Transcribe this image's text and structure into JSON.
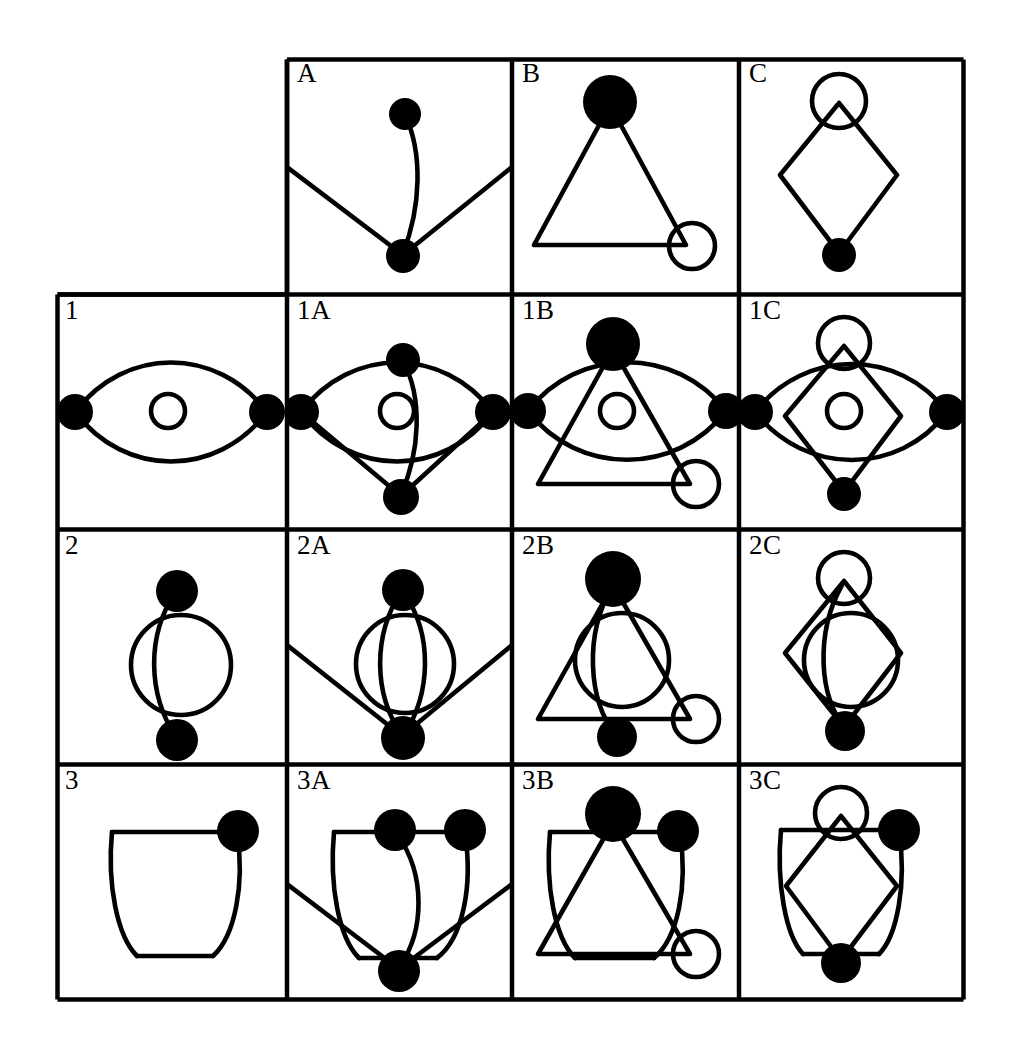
{
  "page": {
    "background_color": "#ffffff",
    "ink_color": "#000000",
    "width": 1021,
    "height": 1050
  },
  "matrix": {
    "rows": 4,
    "columns": 4,
    "corner_label": "",
    "column_headers": [
      "A",
      "B",
      "C"
    ],
    "row_headers": [
      "1",
      "2",
      "3"
    ],
    "border_color": "#000000",
    "cells": [
      {
        "id": "corner",
        "label": "",
        "row": 0,
        "col": 0,
        "figures": []
      },
      {
        "id": "A",
        "label": "A",
        "row": 0,
        "col": 1,
        "figures": [
          "A"
        ]
      },
      {
        "id": "B",
        "label": "B",
        "row": 0,
        "col": 2,
        "figures": [
          "B"
        ]
      },
      {
        "id": "C",
        "label": "C",
        "row": 0,
        "col": 3,
        "figures": [
          "C"
        ]
      },
      {
        "id": "1",
        "label": "1",
        "row": 1,
        "col": 0,
        "figures": [
          "1"
        ]
      },
      {
        "id": "1A",
        "label": "1A",
        "row": 1,
        "col": 1,
        "figures": [
          "1",
          "A"
        ]
      },
      {
        "id": "1B",
        "label": "1B",
        "row": 1,
        "col": 2,
        "figures": [
          "1",
          "B"
        ]
      },
      {
        "id": "1C",
        "label": "1C",
        "row": 1,
        "col": 3,
        "figures": [
          "1",
          "C"
        ]
      },
      {
        "id": "2",
        "label": "2",
        "row": 2,
        "col": 0,
        "figures": [
          "2"
        ]
      },
      {
        "id": "2A",
        "label": "2A",
        "row": 2,
        "col": 1,
        "figures": [
          "2",
          "A"
        ]
      },
      {
        "id": "2B",
        "label": "2B",
        "row": 2,
        "col": 2,
        "figures": [
          "2",
          "B"
        ]
      },
      {
        "id": "2C",
        "label": "2C",
        "row": 2,
        "col": 3,
        "figures": [
          "2",
          "C"
        ]
      },
      {
        "id": "3",
        "label": "3",
        "row": 3,
        "col": 0,
        "figures": [
          "3"
        ]
      },
      {
        "id": "3A",
        "label": "3A",
        "row": 3,
        "col": 1,
        "figures": [
          "3",
          "A"
        ]
      },
      {
        "id": "3B",
        "label": "3B",
        "row": 3,
        "col": 2,
        "figures": [
          "3",
          "B"
        ]
      },
      {
        "id": "3C",
        "label": "3C",
        "row": 3,
        "col": 3,
        "figures": [
          "3",
          "C"
        ]
      }
    ]
  },
  "glyphs": {
    "A": {
      "name": "v-lines-with-curved-stem",
      "description": "Small filled node upper-centre joined by a curve to a filled node at lower centre; two straight lines run from the lower node outward to the left and right cell edges."
    },
    "B": {
      "name": "triangle-filled-apex-open-circle-corner",
      "description": "Triangle with a large filled node at the apex and an open circle at the lower-right corner."
    },
    "C": {
      "name": "diamond-open-circle-top-filled-bottom",
      "description": "Tall diamond with an open circle around the top vertex and a filled node at the bottom vertex."
    },
    "1": {
      "name": "horizontal-lens-two-filled-nodes",
      "description": "Horizontal lens (two arcs) with filled nodes at the left and right tips and a small open circle at the centre."
    },
    "2": {
      "name": "vertical-curve-two-nodes-open-circle",
      "description": "Curve bulging left connecting a filled node at top to a filled node at bottom, with a medium open circle between them."
    },
    "3": {
      "name": "cup-shape-filled-node-top-right",
      "description": "Cup/bucket outline with a filled node at the top-right corner."
    }
  }
}
